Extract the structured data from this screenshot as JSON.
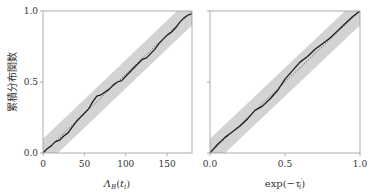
{
  "colors": {
    "band": "#d3d3d3",
    "ecdf": "#1a1a1a",
    "reference": "#444444",
    "axis": "#999999",
    "text": "#333333"
  },
  "chart_data": [
    {
      "type": "line",
      "panel": "left",
      "title": "",
      "xlabel": "Λ_B(t_i)",
      "ylabel": "累積分布関数",
      "xlim": [
        0,
        180
      ],
      "ylim": [
        0,
        1.0
      ],
      "xticks": [
        0,
        50,
        100,
        150
      ],
      "xtick_labels": [
        "0",
        "50",
        "100",
        "150"
      ],
      "yticks": [
        0.0,
        0.5,
        1.0
      ],
      "ytick_labels": [
        "0.0",
        "0.5",
        "1.0"
      ],
      "grid": false,
      "band_halfwidth": 0.1,
      "series": [
        {
          "name": "empirical CDF",
          "style": "solid",
          "x": [
            0,
            5,
            10,
            15,
            20,
            25,
            30,
            35,
            40,
            45,
            50,
            55,
            60,
            65,
            70,
            75,
            80,
            85,
            90,
            95,
            100,
            105,
            110,
            115,
            120,
            125,
            130,
            135,
            140,
            145,
            150,
            155,
            160,
            165,
            170,
            175,
            180
          ],
          "y": [
            0.0,
            0.03,
            0.05,
            0.08,
            0.09,
            0.12,
            0.14,
            0.18,
            0.22,
            0.25,
            0.28,
            0.31,
            0.36,
            0.4,
            0.41,
            0.43,
            0.45,
            0.48,
            0.5,
            0.51,
            0.54,
            0.57,
            0.6,
            0.63,
            0.66,
            0.67,
            0.7,
            0.73,
            0.77,
            0.8,
            0.83,
            0.85,
            0.88,
            0.92,
            0.95,
            0.97,
            0.98
          ]
        },
        {
          "name": "reference",
          "style": "dotted",
          "x": [
            0,
            180
          ],
          "y": [
            0.0,
            1.0
          ]
        }
      ]
    },
    {
      "type": "line",
      "panel": "right",
      "title": "",
      "xlabel": "exp(−τ'_i)",
      "ylabel": "",
      "xlim": [
        0,
        1.0
      ],
      "ylim": [
        0,
        1.0
      ],
      "xticks": [
        0.0,
        0.5,
        1.0
      ],
      "xtick_labels": [
        "0.0",
        "0.5",
        "1.0"
      ],
      "yticks": [
        0.0,
        0.5,
        1.0
      ],
      "ytick_labels": [
        "",
        "",
        ""
      ],
      "grid": false,
      "band_halfwidth": 0.1,
      "series": [
        {
          "name": "empirical CDF",
          "style": "solid",
          "x": [
            0,
            0.05,
            0.1,
            0.15,
            0.2,
            0.25,
            0.3,
            0.35,
            0.4,
            0.45,
            0.5,
            0.55,
            0.6,
            0.65,
            0.7,
            0.75,
            0.8,
            0.85,
            0.9,
            0.95,
            1.0
          ],
          "y": [
            0.0,
            0.06,
            0.11,
            0.15,
            0.19,
            0.24,
            0.3,
            0.33,
            0.38,
            0.44,
            0.52,
            0.58,
            0.64,
            0.68,
            0.73,
            0.77,
            0.81,
            0.86,
            0.91,
            0.96,
            1.0
          ]
        },
        {
          "name": "reference",
          "style": "dotted",
          "x": [
            0,
            1.0
          ],
          "y": [
            0.0,
            1.0
          ]
        }
      ]
    }
  ]
}
